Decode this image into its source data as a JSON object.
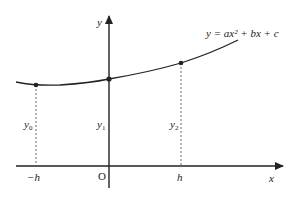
{
  "diagram": {
    "type": "function-graph",
    "curve_label": "y = ax² + bx + c",
    "axes": {
      "x_label": "x",
      "y_label": "y",
      "origin_label": "O"
    },
    "x_ticks": [
      {
        "label": "−h",
        "value": "-h"
      },
      {
        "label": "h",
        "value": "h"
      }
    ],
    "ordinates": [
      {
        "label_base": "y",
        "label_sub": "0",
        "at": "-h"
      },
      {
        "label_base": "y",
        "label_sub": "1",
        "at": "0"
      },
      {
        "label_base": "y",
        "label_sub": "2",
        "at": "h"
      }
    ],
    "colors": {
      "line": "#222222",
      "background": "#ffffff"
    }
  }
}
